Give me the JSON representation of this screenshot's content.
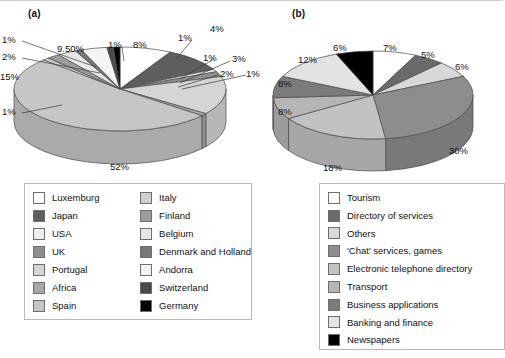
{
  "figure": {
    "panel_a_label": "(a)",
    "panel_b_label": "(b)"
  },
  "chart_data": [
    {
      "type": "pie",
      "id": "chart-a",
      "title": "(a)",
      "legend_position": "bottom",
      "three_d": true,
      "categories": [
        "Luxemburg",
        "Japan",
        "USA",
        "UK",
        "Portugal",
        "Africa",
        "Spain",
        "Italy",
        "Finland",
        "Belgium",
        "Denmark and Holland",
        "Andorra",
        "Switzerland",
        "Germany"
      ],
      "values": [
        8,
        9.5,
        1,
        2,
        15,
        1,
        52,
        1,
        2,
        3,
        1,
        4,
        1,
        1
      ],
      "value_labels": [
        "8%",
        "9.50%",
        "1%",
        "2%",
        "15%",
        "1%",
        "52%",
        "1%",
        "2%",
        "3%",
        "1%",
        "4%",
        "1%",
        "1%"
      ],
      "colors": [
        "#ffffff",
        "#5e5e5e",
        "#efefef",
        "#8f8f8f",
        "#d5d5d5",
        "#a8a8a8",
        "#c6c6c6",
        "#cfcfcf",
        "#9d9d9d",
        "#e7e7e7",
        "#777777",
        "#f4f4f4",
        "#4a4a4a",
        "#000000"
      ]
    },
    {
      "type": "pie",
      "id": "chart-b",
      "title": "(b)",
      "legend_position": "bottom",
      "three_d": true,
      "categories": [
        "Tourism",
        "Directory of services",
        "Others",
        "'Chat' services, games",
        "Electronic telephone directory",
        "Transport",
        "Business applications",
        "Banking and finance",
        "Newspapers"
      ],
      "values": [
        7,
        5,
        6,
        30,
        18,
        8,
        8,
        12,
        6
      ],
      "value_labels": [
        "7%",
        "5%",
        "6%",
        "30%",
        "18%",
        "8%",
        "8%",
        "12%",
        "6%"
      ],
      "colors": [
        "#ffffff",
        "#6a6a6a",
        "#d8d8d8",
        "#8d8d8d",
        "#c2c2c2",
        "#b5b5b5",
        "#7b7b7b",
        "#e3e3e3",
        "#000000"
      ]
    }
  ],
  "chart_a": {
    "labels": [
      {
        "text": "1%",
        "x": 2,
        "y": 18
      },
      {
        "text": "2%",
        "x": 2,
        "y": 35
      },
      {
        "text": "15%",
        "x": 0,
        "y": 55
      },
      {
        "text": "1%",
        "x": 2,
        "y": 90
      },
      {
        "text": "9.50%",
        "x": 57,
        "y": 27
      },
      {
        "text": "1%",
        "x": 108,
        "y": 23
      },
      {
        "text": "8%",
        "x": 133,
        "y": 23
      },
      {
        "text": "1%",
        "x": 178,
        "y": 16
      },
      {
        "text": "4%",
        "x": 210,
        "y": 7
      },
      {
        "text": "1%",
        "x": 203,
        "y": 36
      },
      {
        "text": "3%",
        "x": 232,
        "y": 37
      },
      {
        "text": "2%",
        "x": 220,
        "y": 52
      },
      {
        "text": "1%",
        "x": 246,
        "y": 52
      },
      {
        "text": "52%",
        "x": 110,
        "y": 145
      }
    ]
  },
  "chart_b": {
    "labels": [
      {
        "text": "6%",
        "x": 82,
        "y": 26
      },
      {
        "text": "7%",
        "x": 132,
        "y": 26
      },
      {
        "text": "5%",
        "x": 170,
        "y": 33
      },
      {
        "text": "6%",
        "x": 204,
        "y": 45
      },
      {
        "text": "12%",
        "x": 47,
        "y": 38
      },
      {
        "text": "8%",
        "x": 27,
        "y": 62
      },
      {
        "text": "8%",
        "x": 27,
        "y": 90
      },
      {
        "text": "18%",
        "x": 72,
        "y": 146
      },
      {
        "text": "30%",
        "x": 198,
        "y": 129
      }
    ]
  },
  "legend_a": {
    "column_1": [
      {
        "label": "Luxemburg",
        "color": "#ffffff"
      },
      {
        "label": "Japan",
        "color": "#5e5e5e"
      },
      {
        "label": "USA",
        "color": "#efefef"
      },
      {
        "label": "UK",
        "color": "#8f8f8f"
      },
      {
        "label": "Portugal",
        "color": "#d5d5d5"
      },
      {
        "label": "Africa",
        "color": "#a8a8a8"
      },
      {
        "label": "Spain",
        "color": "#c6c6c6"
      }
    ],
    "column_2": [
      {
        "label": "Italy",
        "color": "#cfcfcf"
      },
      {
        "label": "Finland",
        "color": "#9d9d9d"
      },
      {
        "label": "Belgium",
        "color": "#e7e7e7"
      },
      {
        "label": "Denmark and Holland",
        "color": "#777777"
      },
      {
        "label": "Andorra",
        "color": "#f4f4f4"
      },
      {
        "label": "Switzerland",
        "color": "#4a4a4a"
      },
      {
        "label": "Germany",
        "color": "#000000"
      }
    ]
  },
  "legend_b": {
    "items": [
      {
        "label": "Tourism",
        "color": "#ffffff"
      },
      {
        "label": "Directory of services",
        "color": "#6a6a6a"
      },
      {
        "label": "Others",
        "color": "#d8d8d8"
      },
      {
        "label": "'Chat' services, games",
        "color": "#8d8d8d"
      },
      {
        "label": "Electronic telephone directory",
        "color": "#c2c2c2"
      },
      {
        "label": "Transport",
        "color": "#b5b5b5"
      },
      {
        "label": "Business applications",
        "color": "#7b7b7b"
      },
      {
        "label": "Banking and finance",
        "color": "#e3e3e3"
      },
      {
        "label": "Newspapers",
        "color": "#000000"
      }
    ]
  }
}
